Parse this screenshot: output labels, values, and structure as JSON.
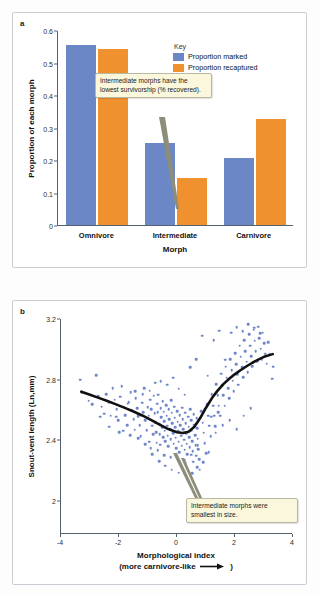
{
  "figure": {
    "panels": [
      {
        "letter": "a",
        "ylabel": "Proportion of each morph",
        "xlabel": "Morph"
      },
      {
        "letter": "b",
        "ylabel": "Snout-vent length (Ln,mm)",
        "xlabel_line1": "Morphological index",
        "xlabel_line2_pre": "(more carnivore-like",
        "xlabel_line2_post": ")"
      }
    ]
  },
  "key": {
    "title": "Key",
    "items": [
      {
        "label": "Proportion marked",
        "color": "#6b87c6"
      },
      {
        "label": "Proportion recaptured",
        "color": "#f0912f"
      }
    ]
  },
  "callouts": {
    "panel_a": "Intermediate morphs have the lowest survivorship (% recovered).",
    "panel_b": "Intermediate morphs were smallest in size."
  },
  "chart_data": [
    {
      "type": "bar",
      "panel": "a",
      "title": "",
      "categories": [
        "Omnivore",
        "Intermediate",
        "Carnivore"
      ],
      "series": [
        {
          "name": "Proportion marked",
          "color": "#6b87c6",
          "values": [
            0.553,
            0.252,
            0.205
          ]
        },
        {
          "name": "Proportion recaptured",
          "color": "#f0912f",
          "values": [
            0.541,
            0.144,
            0.326
          ]
        }
      ],
      "xlabel": "Morph",
      "ylabel": "Proportion of each morph",
      "ylim": [
        0,
        0.6
      ],
      "yticks": [
        "0",
        "0.1",
        "0.2",
        "0.3",
        "0.4",
        "0.5",
        "0.6"
      ],
      "ytickvalues": [
        0,
        0.1,
        0.2,
        0.3,
        0.4,
        0.5,
        0.6
      ],
      "grid": false,
      "legend_position": "top-right"
    },
    {
      "type": "scatter",
      "panel": "b",
      "title": "",
      "xlabel": "Morphological index (more carnivore-like →)",
      "ylabel": "Snout-vent length (Ln,mm)",
      "xlim": [
        -4,
        4
      ],
      "ylim": [
        1.78,
        3.2
      ],
      "xticks": [
        "-4",
        "-2",
        "0",
        "2",
        "4"
      ],
      "xtickvalues": [
        -4,
        -2,
        0,
        2,
        4
      ],
      "yticks": [
        "2",
        "2.4",
        "2.8",
        "3.2"
      ],
      "ytickvalues": [
        2,
        2.4,
        2.8,
        3.2
      ],
      "grid": false,
      "point_color": "#6f86c8",
      "trend_color": "#111111",
      "trend_label": "LOESS fit",
      "trend": [
        [
          -3.3,
          2.72
        ],
        [
          -3.0,
          2.7
        ],
        [
          -2.7,
          2.679
        ],
        [
          -2.4,
          2.658
        ],
        [
          -2.1,
          2.636
        ],
        [
          -1.8,
          2.613
        ],
        [
          -1.5,
          2.589
        ],
        [
          -1.2,
          2.563
        ],
        [
          -0.9,
          2.534
        ],
        [
          -0.6,
          2.503
        ],
        [
          -0.3,
          2.473
        ],
        [
          0.0,
          2.452
        ],
        [
          0.2,
          2.447
        ],
        [
          0.4,
          2.456
        ],
        [
          0.6,
          2.489
        ],
        [
          0.8,
          2.546
        ],
        [
          1.0,
          2.614
        ],
        [
          1.2,
          2.676
        ],
        [
          1.4,
          2.727
        ],
        [
          1.6,
          2.77
        ],
        [
          1.8,
          2.805
        ],
        [
          2.0,
          2.836
        ],
        [
          2.2,
          2.863
        ],
        [
          2.4,
          2.888
        ],
        [
          2.6,
          2.911
        ],
        [
          2.8,
          2.932
        ],
        [
          3.0,
          2.95
        ],
        [
          3.3,
          2.968
        ]
      ],
      "points": [
        [
          -3.33,
          2.8
        ],
        [
          -3.28,
          2.718
        ],
        [
          -3.05,
          2.66
        ],
        [
          -2.92,
          2.636
        ],
        [
          -2.78,
          2.828
        ],
        [
          -2.72,
          2.69
        ],
        [
          -2.6,
          2.622
        ],
        [
          -2.52,
          2.574
        ],
        [
          -2.45,
          2.705
        ],
        [
          -2.36,
          2.648
        ],
        [
          -2.28,
          2.56
        ],
        [
          -2.22,
          2.742
        ],
        [
          -2.15,
          2.666
        ],
        [
          -2.08,
          2.604
        ],
        [
          -2.02,
          2.53
        ],
        [
          -1.96,
          2.688
        ],
        [
          -1.9,
          2.758
        ],
        [
          -1.84,
          2.62
        ],
        [
          -1.78,
          2.566
        ],
        [
          -1.72,
          2.498
        ],
        [
          -1.66,
          2.652
        ],
        [
          -1.6,
          2.716
        ],
        [
          -1.56,
          2.596
        ],
        [
          -1.5,
          2.54
        ],
        [
          -1.46,
          2.47
        ],
        [
          -1.42,
          2.676
        ],
        [
          -1.38,
          2.612
        ],
        [
          -1.33,
          2.558
        ],
        [
          -1.29,
          2.498
        ],
        [
          -1.25,
          2.424
        ],
        [
          -1.21,
          2.648
        ],
        [
          -1.17,
          2.584
        ],
        [
          -1.13,
          2.742
        ],
        [
          -1.09,
          2.53
        ],
        [
          -1.05,
          2.466
        ],
        [
          -1.01,
          2.616
        ],
        [
          -0.98,
          2.56
        ],
        [
          -0.95,
          2.39
        ],
        [
          -0.92,
          2.668
        ],
        [
          -0.89,
          2.604
        ],
        [
          -0.86,
          2.496
        ],
        [
          -0.83,
          2.44
        ],
        [
          -0.8,
          2.694
        ],
        [
          -0.77,
          2.576
        ],
        [
          -0.75,
          2.52
        ],
        [
          -0.72,
          2.452
        ],
        [
          -0.7,
          2.384
        ],
        [
          -0.68,
          2.64
        ],
        [
          -0.66,
          2.586
        ],
        [
          -0.64,
          2.7
        ],
        [
          -0.62,
          2.508
        ],
        [
          -0.6,
          2.438
        ],
        [
          -0.58,
          2.37
        ],
        [
          -0.56,
          2.612
        ],
        [
          -0.54,
          2.552
        ],
        [
          -0.52,
          2.482
        ],
        [
          -0.5,
          2.658
        ],
        [
          -0.48,
          2.418
        ],
        [
          -0.46,
          2.588
        ],
        [
          -0.44,
          2.524
        ],
        [
          -0.42,
          2.462
        ],
        [
          -0.4,
          2.392
        ],
        [
          -0.38,
          2.632
        ],
        [
          -0.36,
          2.56
        ],
        [
          -0.34,
          2.496
        ],
        [
          -0.32,
          2.43
        ],
        [
          -0.3,
          2.358
        ],
        [
          -0.28,
          2.606
        ],
        [
          -0.26,
          2.54
        ],
        [
          -0.24,
          2.474
        ],
        [
          -0.22,
          2.408
        ],
        [
          -0.2,
          2.664
        ],
        [
          -0.18,
          2.58
        ],
        [
          -0.16,
          2.512
        ],
        [
          -0.14,
          2.444
        ],
        [
          -0.12,
          2.376
        ],
        [
          -0.1,
          2.62
        ],
        [
          -0.08,
          2.548
        ],
        [
          -0.06,
          2.484
        ],
        [
          -0.04,
          2.416
        ],
        [
          -0.02,
          2.348
        ],
        [
          0.0,
          2.592
        ],
        [
          0.02,
          2.522
        ],
        [
          0.04,
          2.458
        ],
        [
          0.06,
          2.39
        ],
        [
          0.08,
          2.322
        ],
        [
          0.1,
          2.566
        ],
        [
          0.12,
          2.498
        ],
        [
          0.14,
          2.43
        ],
        [
          0.16,
          2.362
        ],
        [
          0.18,
          2.614
        ],
        [
          0.2,
          2.54
        ],
        [
          0.22,
          2.472
        ],
        [
          0.24,
          2.404
        ],
        [
          0.26,
          2.336
        ],
        [
          0.28,
          2.58
        ],
        [
          0.3,
          2.512
        ],
        [
          0.32,
          2.444
        ],
        [
          0.34,
          2.376
        ],
        [
          0.36,
          2.308
        ],
        [
          0.38,
          2.556
        ],
        [
          0.4,
          2.488
        ],
        [
          0.42,
          2.42
        ],
        [
          0.44,
          2.352
        ],
        [
          0.46,
          2.604
        ],
        [
          0.48,
          2.53
        ],
        [
          0.5,
          2.462
        ],
        [
          0.52,
          2.394
        ],
        [
          0.54,
          2.326
        ],
        [
          0.56,
          2.258
        ],
        [
          0.58,
          2.57
        ],
        [
          0.6,
          2.502
        ],
        [
          0.62,
          2.434
        ],
        [
          0.64,
          2.366
        ],
        [
          0.66,
          2.298
        ],
        [
          0.68,
          2.546
        ],
        [
          0.7,
          2.478
        ],
        [
          0.72,
          2.41
        ],
        [
          0.74,
          2.342
        ],
        [
          0.76,
          2.274
        ],
        [
          0.78,
          2.206
        ],
        [
          0.8,
          1.98
        ],
        [
          0.84,
          2.59
        ],
        [
          0.88,
          2.516
        ],
        [
          0.92,
          2.448
        ],
        [
          0.96,
          2.38
        ],
        [
          1.0,
          2.312
        ],
        [
          1.04,
          2.636
        ],
        [
          1.08,
          2.562
        ],
        [
          1.12,
          2.494
        ],
        [
          1.16,
          2.426
        ],
        [
          1.2,
          2.702
        ],
        [
          1.24,
          2.628
        ],
        [
          1.28,
          2.56
        ],
        [
          1.32,
          2.492
        ],
        [
          1.36,
          2.77
        ],
        [
          1.4,
          2.696
        ],
        [
          1.44,
          2.628
        ],
        [
          1.48,
          2.56
        ],
        [
          1.52,
          2.838
        ],
        [
          1.56,
          2.764
        ],
        [
          1.6,
          2.696
        ],
        [
          1.64,
          2.628
        ],
        [
          1.68,
          2.886
        ],
        [
          1.72,
          2.812
        ],
        [
          1.76,
          2.744
        ],
        [
          1.8,
          2.676
        ],
        [
          1.84,
          2.934
        ],
        [
          1.88,
          2.86
        ],
        [
          1.92,
          2.792
        ],
        [
          1.96,
          2.724
        ],
        [
          2.0,
          2.976
        ],
        [
          2.04,
          2.902
        ],
        [
          2.08,
          2.834
        ],
        [
          2.12,
          2.766
        ],
        [
          2.16,
          3.024
        ],
        [
          2.2,
          2.95
        ],
        [
          2.24,
          2.882
        ],
        [
          2.28,
          2.814
        ],
        [
          2.32,
          3.06
        ],
        [
          2.36,
          2.986
        ],
        [
          2.4,
          2.918
        ],
        [
          2.44,
          2.85
        ],
        [
          2.48,
          3.098
        ],
        [
          2.52,
          3.024
        ],
        [
          2.56,
          2.956
        ],
        [
          2.6,
          2.888
        ],
        [
          2.64,
          3.13
        ],
        [
          2.68,
          3.056
        ],
        [
          2.72,
          2.988
        ],
        [
          2.76,
          2.92
        ],
        [
          2.8,
          3.15
        ],
        [
          2.84,
          3.072
        ],
        [
          2.88,
          3.004
        ],
        [
          2.92,
          2.936
        ],
        [
          2.96,
          3.11
        ],
        [
          3.0,
          3.04
        ],
        [
          3.05,
          2.972
        ],
        [
          3.1,
          2.904
        ],
        [
          3.15,
          3.046
        ],
        [
          3.2,
          2.966
        ],
        [
          3.28,
          2.806
        ],
        [
          3.32,
          2.884
        ],
        [
          -2.64,
          2.556
        ],
        [
          -2.34,
          2.49
        ],
        [
          -1.99,
          2.454
        ],
        [
          -1.7,
          2.64
        ],
        [
          -1.44,
          2.724
        ],
        [
          -1.18,
          2.702
        ],
        [
          -0.94,
          2.726
        ],
        [
          -0.76,
          2.78
        ],
        [
          -0.56,
          2.79
        ],
        [
          -0.34,
          2.766
        ],
        [
          -0.14,
          2.812
        ],
        [
          0.06,
          2.74
        ],
        [
          0.26,
          2.7
        ],
        [
          0.46,
          2.88
        ],
        [
          0.66,
          2.934
        ],
        [
          0.86,
          3.09
        ],
        [
          1.06,
          2.826
        ],
        [
          1.26,
          3.06
        ],
        [
          1.46,
          3.124
        ],
        [
          1.66,
          2.932
        ],
        [
          1.86,
          3.11
        ],
        [
          2.06,
          3.146
        ],
        [
          2.26,
          3.12
        ],
        [
          2.46,
          3.166
        ],
        [
          2.66,
          3.142
        ],
        [
          2.86,
          3.106
        ],
        [
          -0.86,
          2.306
        ],
        [
          -0.62,
          2.262
        ],
        [
          -0.4,
          2.23
        ],
        [
          -0.18,
          2.206
        ],
        [
          0.06,
          2.186
        ],
        [
          0.3,
          2.25
        ],
        [
          0.52,
          2.182
        ],
        [
          0.7,
          2.222
        ],
        [
          0.9,
          2.256
        ],
        [
          1.1,
          2.322
        ],
        [
          1.34,
          2.448
        ],
        [
          1.58,
          2.5
        ],
        [
          1.82,
          2.53
        ],
        [
          2.06,
          2.472
        ],
        [
          2.3,
          2.56
        ],
        [
          2.54,
          2.612
        ],
        [
          -2.1,
          2.556
        ],
        [
          -1.86,
          2.462
        ],
        [
          -1.62,
          2.432
        ],
        [
          -1.34,
          2.412
        ],
        [
          -1.1,
          2.372
        ],
        [
          -0.9,
          2.346
        ],
        [
          -0.66,
          2.332
        ],
        [
          -0.44,
          2.3
        ],
        [
          -0.22,
          2.288
        ],
        [
          0.02,
          2.272
        ],
        [
          0.24,
          2.266
        ],
        [
          0.48,
          2.304
        ],
        [
          0.72,
          2.366
        ],
        [
          0.96,
          2.604
        ],
        [
          1.18,
          2.556
        ],
        [
          1.42,
          2.586
        ]
      ]
    }
  ]
}
